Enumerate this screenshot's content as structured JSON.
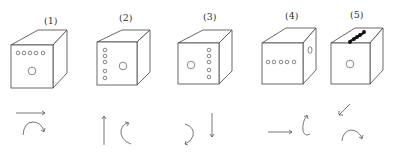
{
  "figure": {
    "type": "cube-orientation-puzzle",
    "cubes": [
      {
        "label": "(1)",
        "front_face": "row of 5 small holes across top, 1 large hole center-bottom",
        "side_face": "blank",
        "top_face": "blank"
      },
      {
        "label": "(2)",
        "front_face": "column of 5 small holes on left, 1 large hole center-right",
        "side_face": "blank",
        "top_face": "blank"
      },
      {
        "label": "(3)",
        "front_face": "1 large hole left, column of 5 small holes on right",
        "side_face": "blank",
        "top_face": "blank"
      },
      {
        "label": "(4)",
        "front_face": "row of 5 small holes across middle",
        "side_face": "1 large hole",
        "top_face": "blank"
      },
      {
        "label": "(5)",
        "front_face": "1 large hole center",
        "side_face": "blank",
        "top_face": "diagonal row of 5 filled holes"
      }
    ],
    "arrow_pairs": [
      {
        "between": "(1)-(2)",
        "translation": "right",
        "rotation": "clockwise arc over the top"
      },
      {
        "between": "(2)-(3)",
        "translation": "up",
        "rotation": "counterclockwise, left-side arc"
      },
      {
        "between": "(3)-(4)",
        "translation": "down",
        "rotation": "clockwise, right-side arc downward"
      },
      {
        "between": "(4)-(5)",
        "translation": "right",
        "rotation": "vertical loop, tilted"
      },
      {
        "between": "(5)",
        "translation": "down-left diagonal",
        "rotation": "clockwise arc over the top"
      }
    ]
  },
  "labels": {
    "cube1": "(1)",
    "cube2": "(2)",
    "cube3": "(3)",
    "cube4": "(4)",
    "cube5": "(5)"
  }
}
